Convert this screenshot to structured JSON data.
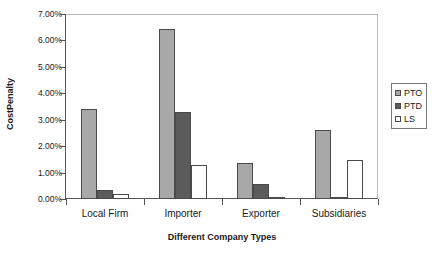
{
  "chart_data": {
    "type": "bar",
    "title": "",
    "xlabel": "Different Company Types",
    "ylabel": "CostPenalty",
    "categories": [
      "Local Firm",
      "Importer",
      "Exporter",
      "Subsidiaries"
    ],
    "series": [
      {
        "name": "PTO",
        "color": "#a8a8a8",
        "values": [
          3.41,
          6.45,
          1.36,
          2.62
        ]
      },
      {
        "name": "PTD",
        "color": "#5b5b5b",
        "values": [
          0.33,
          3.3,
          0.55,
          0.03
        ]
      },
      {
        "name": "LS",
        "color": "#ffffff",
        "values": [
          0.2,
          1.28,
          0.03,
          1.47
        ]
      }
    ],
    "ylim": [
      0,
      7
    ],
    "ytick_step": 1,
    "ytick_labels": [
      "0.00%",
      "1.00%",
      "2.00%",
      "3.00%",
      "4.00%",
      "5.00%",
      "6.00%",
      "7.00%"
    ],
    "yunit": "%",
    "grid": false,
    "legend_position": "right",
    "plot_border_color": "#b9b9b9",
    "axis_color": "#555555",
    "background": "#ffffff"
  },
  "legend": {
    "items": [
      {
        "label": "PTO"
      },
      {
        "label": "PTD"
      },
      {
        "label": "LS"
      }
    ]
  }
}
